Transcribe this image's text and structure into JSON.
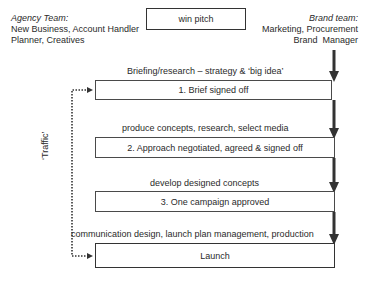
{
  "agency_team": {
    "title": "Agency Team:",
    "line1": "New Business, Account Handler",
    "line2": "Planner, Creatives"
  },
  "brand_team": {
    "title": "Brand team:",
    "line1": "Marketing, Procurement",
    "line2": "Brand  Manager"
  },
  "pitch_box": "win pitch",
  "stages": [
    {
      "activity": "Briefing/research – strategy & ‘big idea’",
      "milestone": "1. Brief signed off"
    },
    {
      "activity": "produce concepts, research, select media",
      "milestone": "2. Approach negotiated, agreed & signed off"
    },
    {
      "activity": "develop designed concepts",
      "milestone": "3. One campaign approved"
    },
    {
      "activity": "communication design, launch plan management, production",
      "milestone": "Launch"
    }
  ],
  "traffic_label": "‘Traffic’",
  "colors": {
    "arrow": "#333333",
    "border": "#4a4a4a",
    "text": "#2a2a2a"
  }
}
